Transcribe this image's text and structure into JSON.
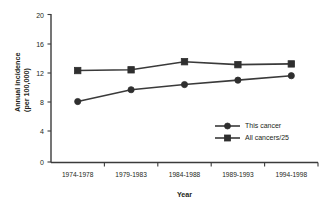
{
  "chart_data": {
    "type": "line",
    "title": "",
    "xlabel": "Year",
    "ylabel": "Annual incidence\n(per 100,000)",
    "ylabel_line1": "Annual incidence",
    "ylabel_line2": "(per 100,000)",
    "categories": [
      "1974-1978",
      "1979-1983",
      "1984-1988",
      "1989-1993",
      "1994-1998"
    ],
    "ylim": [
      0,
      20
    ],
    "yticks": [
      0,
      4,
      8,
      12,
      16,
      20
    ],
    "ytick_labels": [
      "0",
      "4",
      "8",
      "12",
      "16",
      "20"
    ],
    "grid": false,
    "legend_position": "inside-lower-right",
    "series": [
      {
        "name": "This cancer",
        "marker": "circle",
        "color": "#2f2f2f",
        "values": [
          8.2,
          9.8,
          10.5,
          11.1,
          11.7
        ]
      },
      {
        "name": "All cancers/25",
        "marker": "square",
        "color": "#2f2f2f",
        "values": [
          12.4,
          12.5,
          13.6,
          13.2,
          13.3
        ]
      }
    ]
  },
  "legend": {
    "items": [
      {
        "label": "This cancer",
        "marker": "circle"
      },
      {
        "label": "All cancers/25",
        "marker": "square"
      }
    ]
  },
  "colors": {
    "axis": "#3b3b3b",
    "series": "#2f2f2f",
    "text": "#231f20",
    "background": "#ffffff"
  }
}
